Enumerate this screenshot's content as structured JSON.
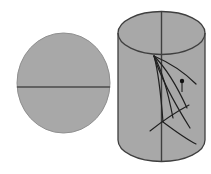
{
  "figure": {
    "background_color": "#ffffff",
    "width": 211,
    "height": 174,
    "fill_color": "#a8a8a8",
    "stroke_color": "#4a4a4a",
    "accent_color": "#1a1a1a"
  },
  "disk": {
    "name": "cross-section-disk",
    "center_x": 63.5,
    "center_y": 83,
    "radius_x": 46.5,
    "radius_y": 50,
    "fill": "#a8a8a8",
    "stroke": "#8f8f8f",
    "chord": {
      "name": "horizontal-diameter",
      "x1": 17,
      "y1": 87,
      "x2": 110,
      "y2": 87,
      "stroke": "#4a4a4a",
      "stroke_width": 1.6
    }
  },
  "cylinder": {
    "name": "cylinder-solid",
    "left_x": 118,
    "right_x": 205,
    "top_ellipse_cy": 33,
    "top_ellipse_rx": 43.5,
    "top_ellipse_ry": 21.5,
    "bottom_ellipse_cy": 140,
    "bottom_ellipse_rx": 43.5,
    "bottom_ellipse_ry": 21.5,
    "fill": "#a8a8a8",
    "stroke": "#3f3f3f",
    "stroke_width": 1.3,
    "axis_line": {
      "name": "cylinder-vertical-axis",
      "x": 161.5,
      "y_top": 12,
      "y_bottom": 161,
      "stroke": "#3f3f3f",
      "stroke_width": 1.4
    }
  },
  "geodesics": {
    "name": "geodesic-curve-bundle",
    "vertex_x": 154,
    "vertex_y": 56,
    "stroke": "#1f1f1f",
    "stroke_width": 1.2,
    "paths": [
      "M154,56 C 168,62 182,70 196,84",
      "M154,56 C 166,68 176,84 187,108",
      "M154,56 C 163,72 168,92 173,118",
      "M154,56 C 159,74 161,96 163,122",
      "M154,56 C 160,76 170,96 190,128"
    ],
    "lower_arc": "M150,131 C 160,123 174,113 189,105",
    "lower_arc_2": "M163,122 C 175,131 186,139 196,144"
  },
  "marker": {
    "name": "point-marker",
    "x": 182,
    "y": 81,
    "radius": 2.2,
    "fill": "#111111",
    "tick": {
      "name": "marker-tick",
      "x1": 182,
      "y1": 83,
      "x2": 182,
      "y2": 92,
      "stroke": "#1f1f1f",
      "stroke_width": 1.1
    }
  },
  "labels": {
    "disk_label": "",
    "cylinder_label": "",
    "marker_label": ""
  }
}
